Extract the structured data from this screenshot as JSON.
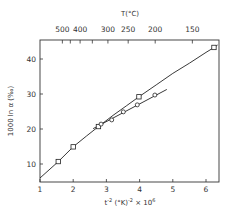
{
  "chart_data": {
    "type": "line",
    "title": "",
    "xlabel": "t⁻² (°K)⁻² × 10⁶",
    "ylabel": "1000 ln α (‰)",
    "top_axis_label": "T(°C)",
    "xlim": [
      1,
      6.4
    ],
    "ylim": [
      5,
      45.5
    ],
    "grid": false,
    "legend": null,
    "x_ticks": [
      1,
      2,
      3,
      4,
      5,
      6
    ],
    "y_ticks": [
      10,
      20,
      30,
      40
    ],
    "top_ticks": [
      {
        "label": "500",
        "celsius": 500,
        "show_label": true
      },
      {
        "label": "",
        "celsius": 450,
        "show_label": false
      },
      {
        "label": "400",
        "celsius": 400,
        "show_label": true
      },
      {
        "label": "",
        "celsius": 350,
        "show_label": false
      },
      {
        "label": "300",
        "celsius": 300,
        "show_label": true
      },
      {
        "label": "250",
        "celsius": 250,
        "show_label": true
      },
      {
        "label": "200",
        "celsius": 200,
        "show_label": true
      },
      {
        "label": "150",
        "celsius": 150,
        "show_label": true
      }
    ],
    "series": [
      {
        "name": "squares (curve)",
        "marker": "square",
        "points": [
          [
            1.55,
            10.7
          ],
          [
            2.0,
            14.9
          ],
          [
            2.76,
            20.7
          ],
          [
            3.98,
            29.2
          ],
          [
            6.24,
            43.3
          ]
        ],
        "curve": [
          [
            1.0,
            6.0
          ],
          [
            1.55,
            10.7
          ],
          [
            2.0,
            14.9
          ],
          [
            2.4,
            18.0
          ],
          [
            2.76,
            20.7
          ],
          [
            3.2,
            23.9
          ],
          [
            3.6,
            26.6
          ],
          [
            3.98,
            29.2
          ],
          [
            4.5,
            32.6
          ],
          [
            5.0,
            35.9
          ],
          [
            5.5,
            38.8
          ],
          [
            6.0,
            41.9
          ],
          [
            6.24,
            43.3
          ],
          [
            6.35,
            44.0
          ]
        ]
      },
      {
        "name": "circles (straight line)",
        "marker": "circle",
        "points": [
          [
            2.84,
            21.4
          ],
          [
            3.16,
            22.6
          ],
          [
            3.51,
            24.9
          ],
          [
            3.93,
            26.9
          ],
          [
            4.46,
            29.7
          ]
        ],
        "line": [
          [
            2.6,
            20.1
          ],
          [
            4.82,
            31.3
          ]
        ]
      }
    ]
  }
}
